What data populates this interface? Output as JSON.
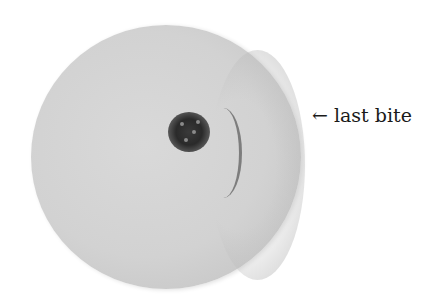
{
  "figure": {
    "annotation": {
      "arrow": "←",
      "text": "last bite"
    },
    "colors": {
      "background": "#ffffff",
      "disc": "#d4d4d4",
      "spot": "#2a2a2a",
      "arc": "#6f6f6f",
      "text": "#1a1a1a"
    }
  }
}
